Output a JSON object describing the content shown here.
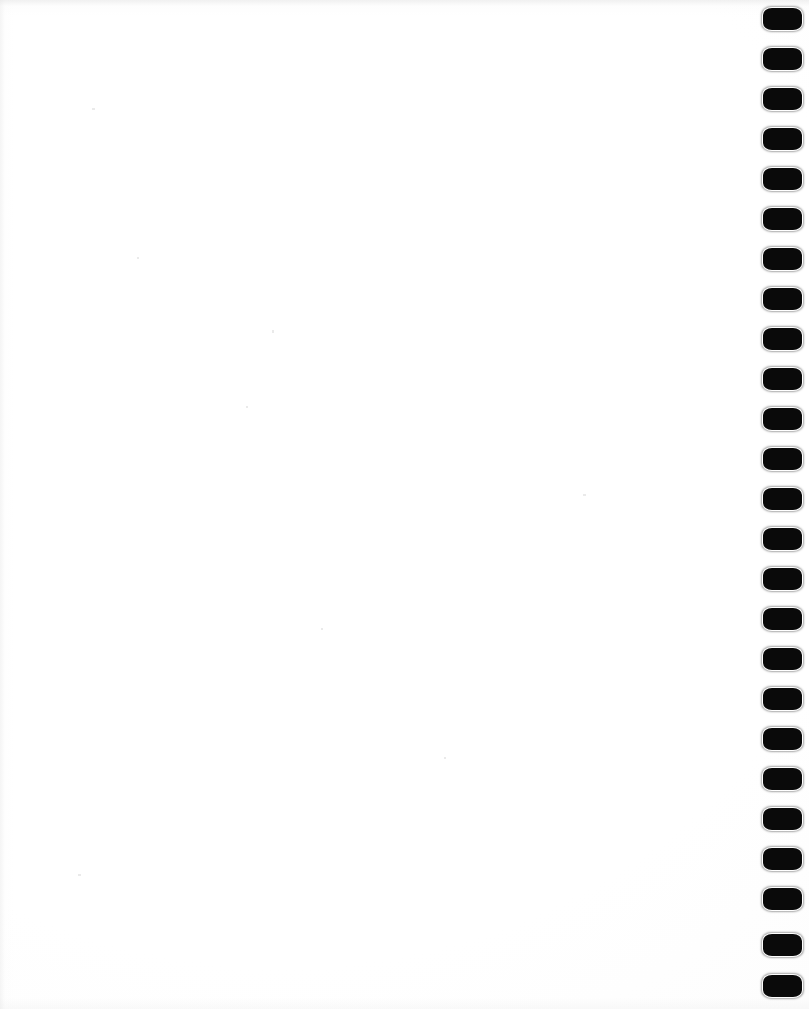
{
  "document": {
    "kind": "scanned-page",
    "page_state": "blank",
    "visible_text": "",
    "width_px": 809,
    "height_px": 1009
  },
  "page": {
    "background_color": "#ffffff",
    "paper_tone": "#fdfdfd",
    "edge_shadow_color": "#e4e4e4"
  },
  "binding": {
    "type": "comb-binding-punch-holes",
    "edge": "right",
    "mark_color": "#0a0a0a",
    "mark_count": 25,
    "mark_width_px": 39,
    "mark_height_px": 22,
    "mark_spacing_px": 40,
    "first_mark_top_px": 8,
    "strip_left_px": 761,
    "marks": [
      {
        "index": 1,
        "top": 8
      },
      {
        "index": 2,
        "top": 48
      },
      {
        "index": 3,
        "top": 88
      },
      {
        "index": 4,
        "top": 128
      },
      {
        "index": 5,
        "top": 168
      },
      {
        "index": 6,
        "top": 208
      },
      {
        "index": 7,
        "top": 248
      },
      {
        "index": 8,
        "top": 288
      },
      {
        "index": 9,
        "top": 328
      },
      {
        "index": 10,
        "top": 368
      },
      {
        "index": 11,
        "top": 408
      },
      {
        "index": 12,
        "top": 448
      },
      {
        "index": 13,
        "top": 488
      },
      {
        "index": 14,
        "top": 528
      },
      {
        "index": 15,
        "top": 568
      },
      {
        "index": 16,
        "top": 608
      },
      {
        "index": 17,
        "top": 648
      },
      {
        "index": 18,
        "top": 688
      },
      {
        "index": 19,
        "top": 728
      },
      {
        "index": 20,
        "top": 768
      },
      {
        "index": 21,
        "top": 808
      },
      {
        "index": 22,
        "top": 848
      },
      {
        "index": 23,
        "top": 888
      },
      {
        "index": 24,
        "top": 934
      },
      {
        "index": 25,
        "top": 975
      }
    ]
  },
  "scan_artifacts": {
    "specks": [
      {
        "x": 92,
        "y": 108,
        "w": 3,
        "h": 2
      },
      {
        "x": 272,
        "y": 330,
        "w": 2,
        "h": 3
      },
      {
        "x": 137,
        "y": 257,
        "w": 2,
        "h": 2
      },
      {
        "x": 321,
        "y": 628,
        "w": 2,
        "h": 2
      },
      {
        "x": 583,
        "y": 494,
        "w": 3,
        "h": 2
      },
      {
        "x": 444,
        "y": 757,
        "w": 2,
        "h": 2
      },
      {
        "x": 78,
        "y": 874,
        "w": 3,
        "h": 2
      },
      {
        "x": 246,
        "y": 406,
        "w": 2,
        "h": 2
      }
    ]
  }
}
